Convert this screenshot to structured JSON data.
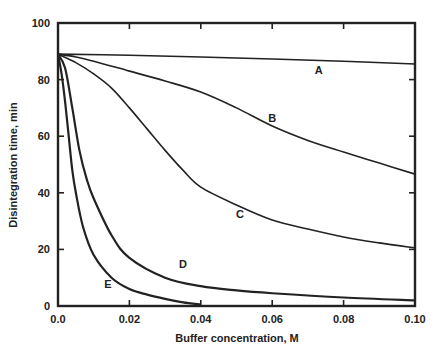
{
  "chart_data": {
    "type": "line",
    "title": "",
    "xlabel": "Buffer concentration, M",
    "ylabel": "Disintegration time, min",
    "xlim": [
      0.0,
      0.1
    ],
    "ylim": [
      0,
      100
    ],
    "xticks": [
      "0.0",
      "0.02",
      "0.04",
      "0.06",
      "0.08",
      "0.10"
    ],
    "yticks": [
      "0",
      "20",
      "40",
      "60",
      "80",
      "100"
    ],
    "grid": false,
    "legend": "inline labels",
    "series": [
      {
        "name": "A",
        "label_pos": [
          0.073,
          82
        ],
        "x": [
          0.0,
          0.02,
          0.04,
          0.06,
          0.08,
          0.1
        ],
        "y": [
          89,
          88.6,
          88,
          87.3,
          86.5,
          85.5
        ]
      },
      {
        "name": "B",
        "label_pos": [
          0.06,
          65
        ],
        "x": [
          0.0,
          0.005,
          0.01,
          0.02,
          0.03,
          0.04,
          0.05,
          0.06,
          0.07,
          0.08,
          0.09,
          0.1
        ],
        "y": [
          89,
          88,
          86.5,
          83,
          79.5,
          75.6,
          70,
          63.6,
          58.5,
          54.4,
          50.5,
          46.6
        ]
      },
      {
        "name": "C",
        "label_pos": [
          0.051,
          31
        ],
        "x": [
          0.0,
          0.005,
          0.01,
          0.015,
          0.02,
          0.025,
          0.03,
          0.035,
          0.04,
          0.05,
          0.06,
          0.07,
          0.08,
          0.09,
          0.1
        ],
        "y": [
          89,
          86,
          82,
          77,
          70,
          62.5,
          55,
          48,
          42,
          35.7,
          30.4,
          27.2,
          24.4,
          22.3,
          20.5
        ]
      },
      {
        "name": "D",
        "label_pos": [
          0.035,
          13.5
        ],
        "x": [
          0.0,
          0.002,
          0.004,
          0.006,
          0.008,
          0.01,
          0.015,
          0.02,
          0.03,
          0.04,
          0.05,
          0.06,
          0.08,
          0.1
        ],
        "y": [
          89,
          84,
          70,
          55,
          45,
          38,
          25,
          17,
          10,
          7,
          5.5,
          4.5,
          3,
          2
        ]
      },
      {
        "name": "E",
        "label_pos": [
          0.014,
          6.5
        ],
        "x": [
          0.0,
          0.001,
          0.002,
          0.003,
          0.004,
          0.005,
          0.007,
          0.01,
          0.015,
          0.02,
          0.025,
          0.03,
          0.035,
          0.04
        ],
        "y": [
          89,
          82,
          72,
          60,
          48,
          40,
          28,
          18,
          10,
          6,
          4,
          2.5,
          1.3,
          0.5
        ]
      }
    ]
  }
}
